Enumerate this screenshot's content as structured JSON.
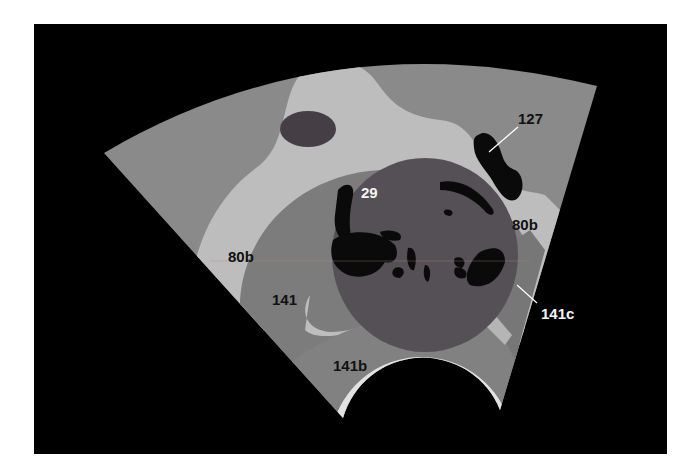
{
  "figure": {
    "type": "ultrasound-sector-schematic",
    "colors": {
      "page_background": "#ffffff",
      "frame_background": "#000000",
      "sector_outer": "#8a8a8a",
      "light_region": "#bdbdbd",
      "mid_region": "#7c7c7c",
      "dark_mass": "#555055",
      "cyst": "#453f45",
      "black_structures": "#0a0a0a",
      "bottom_arc": "#e2e2e2",
      "label_dark": "#111111",
      "label_light": "#f4f4f4",
      "guide_line": "#c08080"
    },
    "labels": {
      "l127": "127",
      "l29": "29",
      "l80b_right": "80b",
      "l80b_left": "80b",
      "l141": "141",
      "l141b": "141b",
      "l141c": "141c"
    }
  }
}
